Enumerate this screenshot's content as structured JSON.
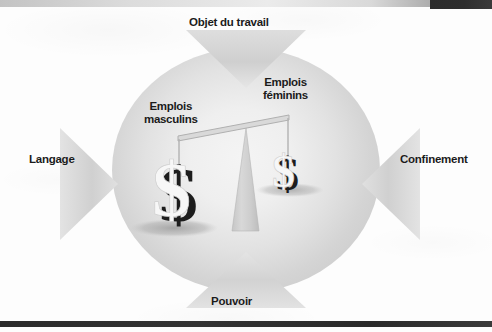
{
  "page": {
    "width": 492,
    "height": 332,
    "background_color": "#fdfdfd",
    "language": "fr"
  },
  "scan_marks": {
    "top_dark_bar_color": "#2e2e2e",
    "top_gray_band_color": "#d6d6d6",
    "bottom_rule_color": "#2b2b2b"
  },
  "diagram": {
    "type": "balance-scale-pressure-diagram",
    "center": {
      "circle_fill_center": "#f4f4f4",
      "circle_fill_edge": "#cdcdcd",
      "tilt": "left-side-down",
      "fulcrum_color": "#cfcfcf",
      "beam_color": "#d5d5d5"
    },
    "pans": [
      {
        "id": "masculins",
        "label_line1": "Emplois",
        "label_line2": "masculins",
        "side": "left",
        "weight": "heavy",
        "symbol": "dollar-sign",
        "symbol_size": "large"
      },
      {
        "id": "feminins",
        "label_line1": "Emplois",
        "label_line2": "féminins",
        "side": "right",
        "weight": "light",
        "symbol": "dollar-sign",
        "symbol_size": "small"
      }
    ],
    "arrows": [
      {
        "id": "objet-du-travail",
        "label": "Objet du travail",
        "position": "top",
        "direction": "down",
        "fill": "#d0d0d0"
      },
      {
        "id": "langage",
        "label": "Langage",
        "position": "left",
        "direction": "right",
        "fill": "#d0d0d0"
      },
      {
        "id": "confinement",
        "label": "Confinement",
        "position": "right",
        "direction": "left",
        "fill": "#d0d0d0"
      },
      {
        "id": "pouvoir",
        "label": "Pouvoir",
        "position": "bottom",
        "direction": "up",
        "fill": "#d0d0d0"
      }
    ]
  }
}
